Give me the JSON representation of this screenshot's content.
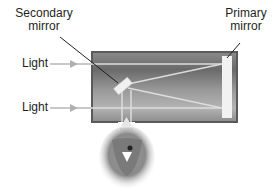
{
  "diagram": {
    "type": "newtonian-reflecting-telescope",
    "labels": {
      "secondary_mirror": [
        "Secondary",
        "mirror"
      ],
      "primary_mirror": [
        "Primary",
        "mirror"
      ],
      "light_top": "Light",
      "light_bottom": "Light"
    },
    "colors": {
      "tube_dark": "#6e6e6e",
      "tube_light": "#b8b8b8",
      "tube_border": "#5a5a5a",
      "light_ray": "#d8d8d8",
      "arrow": "#b0b0b0",
      "mirror": "#f2f2f2",
      "leader_line": "#231f20",
      "text": "#231f20"
    }
  }
}
